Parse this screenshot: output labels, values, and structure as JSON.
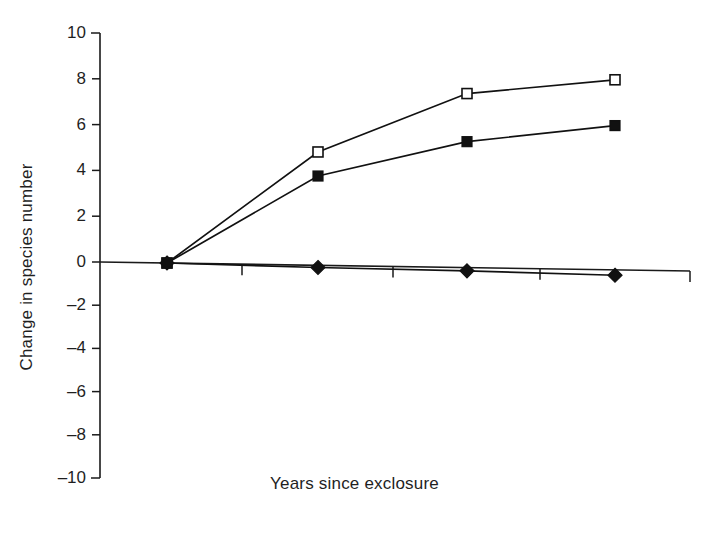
{
  "chart_data": {
    "type": "line",
    "title": "",
    "subtitle": "",
    "xlabel": "Years since exclosure",
    "ylabel": "Change in species number",
    "x": [
      0,
      1,
      2,
      3
    ],
    "xlim": [
      -0.12,
      3.5
    ],
    "ylim": [
      -10,
      10
    ],
    "ytick_labels": [
      "10",
      "8",
      "6",
      "4",
      "2",
      "0",
      "–2",
      "–4",
      "–6",
      "–8",
      "–10"
    ],
    "ytick_values": [
      10,
      8,
      6,
      4,
      2,
      0,
      -2,
      -4,
      -6,
      -8,
      -10
    ],
    "xtick_labels": [],
    "grid": false,
    "legend": "none",
    "series": [
      {
        "name": "open-square-series",
        "marker": "open-square",
        "values": [
          0.0,
          4.95,
          7.6,
          8.3
        ]
      },
      {
        "name": "filled-square-series",
        "marker": "filled-square",
        "values": [
          0.0,
          3.9,
          5.5,
          6.3
        ]
      },
      {
        "name": "filled-diamond-series",
        "marker": "filled-diamond",
        "values": [
          0.0,
          -0.1,
          -0.15,
          -0.25
        ]
      }
    ]
  },
  "axes": {
    "y_axis_name": "Change in species number",
    "x_axis_name": "Years since exclosure"
  },
  "colors": {
    "ink": "#1a1a1a",
    "marker_fill": "#111111",
    "marker_open_fill": "#ffffff",
    "background": "#ffffff"
  }
}
